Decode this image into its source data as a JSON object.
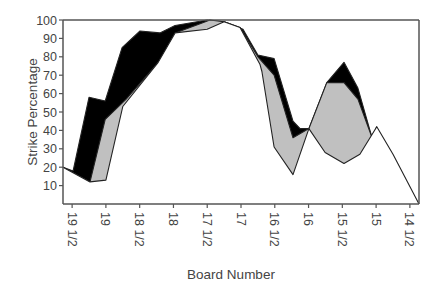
{
  "chart_data": {
    "type": "area",
    "title": "",
    "xlabel": "Board Number",
    "ylabel": "Strike Percentage",
    "ylim": [
      0,
      100
    ],
    "yticks": [
      10,
      20,
      30,
      40,
      50,
      60,
      70,
      80,
      90,
      100
    ],
    "categories": [
      "19 1/2",
      "19",
      "18 1/2",
      "18",
      "17 1/2",
      "17",
      "16 1/2",
      "16",
      "15 1/2",
      "15",
      "14 1/2"
    ],
    "x_range": [
      -0.27,
      10.27
    ],
    "grid": false,
    "legend": null,
    "series": [
      {
        "name": "upper (black band top)",
        "fill": "#000000",
        "points": [
          [
            -0.27,
            20
          ],
          [
            0.03,
            18
          ],
          [
            0.5,
            58
          ],
          [
            0.98,
            56
          ],
          [
            1.48,
            85
          ],
          [
            2.01,
            94
          ],
          [
            2.6,
            93
          ],
          [
            3.05,
            97
          ],
          [
            4.0,
            100
          ],
          [
            4.5,
            99
          ],
          [
            5.06,
            95
          ],
          [
            5.5,
            81
          ],
          [
            5.98,
            79
          ],
          [
            6.54,
            45
          ],
          [
            6.75,
            41
          ],
          [
            7.01,
            41
          ],
          [
            7.54,
            66
          ],
          [
            8.05,
            77
          ],
          [
            8.46,
            63
          ],
          [
            8.88,
            36
          ],
          [
            9.02,
            42
          ]
        ]
      },
      {
        "name": "middle (gray band top)",
        "fill": "#c0c0c0",
        "points": [
          [
            -0.27,
            20
          ],
          [
            0.53,
            12
          ],
          [
            0.98,
            46
          ],
          [
            1.6,
            57
          ],
          [
            2.6,
            78
          ],
          [
            3.05,
            93
          ],
          [
            3.79,
            98
          ],
          [
            4.08,
            100
          ],
          [
            4.5,
            99
          ],
          [
            4.97,
            96
          ],
          [
            5.5,
            80
          ],
          [
            5.98,
            70
          ],
          [
            6.54,
            36
          ],
          [
            7.01,
            41
          ],
          [
            7.54,
            66
          ],
          [
            8.05,
            66
          ],
          [
            8.46,
            57
          ],
          [
            8.88,
            36
          ],
          [
            9.02,
            42
          ]
        ]
      },
      {
        "name": "lower (white line)",
        "fill": "#ffffff",
        "points": [
          [
            -0.27,
            20
          ],
          [
            0.53,
            12
          ],
          [
            1.0,
            13
          ],
          [
            1.5,
            53
          ],
          [
            2.55,
            77
          ],
          [
            3.05,
            93
          ],
          [
            4.0,
            95
          ],
          [
            4.5,
            99
          ],
          [
            4.97,
            96
          ],
          [
            5.56,
            76
          ],
          [
            5.62,
            72
          ],
          [
            5.98,
            31
          ],
          [
            6.54,
            16
          ],
          [
            7.01,
            41
          ],
          [
            7.49,
            28
          ],
          [
            8.05,
            22
          ],
          [
            8.52,
            27
          ],
          [
            9.02,
            42
          ],
          [
            9.5,
            27
          ],
          [
            10.27,
            0
          ]
        ]
      }
    ]
  },
  "axes": {
    "x_title": "Board Number",
    "y_title": "Strike Percentage"
  }
}
